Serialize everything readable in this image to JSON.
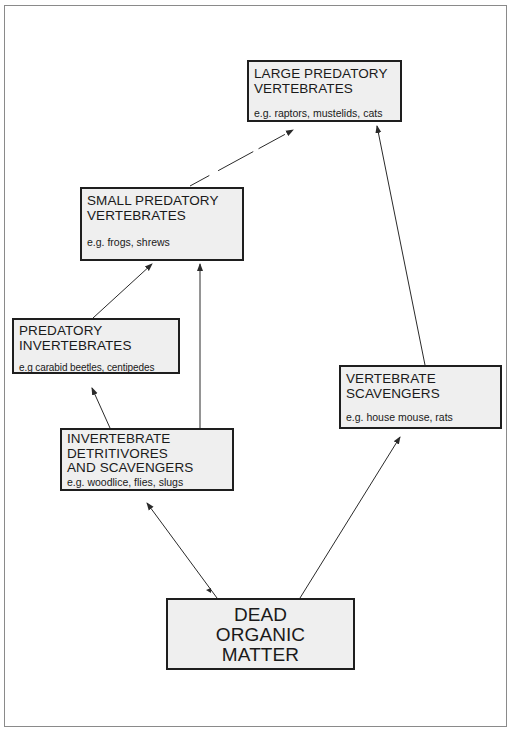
{
  "diagram": {
    "type": "food-web",
    "nodes": {
      "large_predatory_vertebrates": {
        "title_line1": "LARGE PREDATORY",
        "title_line2": "VERTEBRATES",
        "examples": "e.g.  raptors,  mustelids, cats"
      },
      "small_predatory_vertebrates": {
        "title_line1": "SMALL PREDATORY",
        "title_line2": "VERTEBRATES",
        "examples": "e.g.  frogs, shrews"
      },
      "predatory_invertebrates": {
        "title_line1": "PREDATORY",
        "title_line2": "INVERTEBRATES",
        "examples": "e.g carabid beetles, centipedes"
      },
      "invertebrate_detritivores": {
        "title_line1": "INVERTEBRATE",
        "title_line2": "DETRITIVORES",
        "title_line3": "AND SCAVENGERS",
        "examples": "e.g. woodlice, flies, slugs"
      },
      "vertebrate_scavengers": {
        "title_line1": "VERTEBRATE",
        "title_line2": "SCAVENGERS",
        "examples": "e.g. house mouse, rats"
      },
      "dead_organic_matter": {
        "title_line1": "DEAD",
        "title_line2": "ORGANIC",
        "title_line3": "MATTER"
      }
    },
    "edges": [
      {
        "from": "dead_organic_matter",
        "to": "invertebrate_detritivores"
      },
      {
        "from": "dead_organic_matter",
        "to": "vertebrate_scavengers"
      },
      {
        "from": "invertebrate_detritivores",
        "to": "predatory_invertebrates"
      },
      {
        "from": "invertebrate_detritivores",
        "to": "small_predatory_vertebrates"
      },
      {
        "from": "predatory_invertebrates",
        "to": "small_predatory_vertebrates"
      },
      {
        "from": "small_predatory_vertebrates",
        "to": "large_predatory_vertebrates"
      },
      {
        "from": "vertebrate_scavengers",
        "to": "large_predatory_vertebrates"
      }
    ],
    "colors": {
      "box_fill": "#efefef",
      "box_border": "#1e1e1e",
      "arrow": "#2a2a2a",
      "frame_border": "#8a8a8a"
    }
  }
}
